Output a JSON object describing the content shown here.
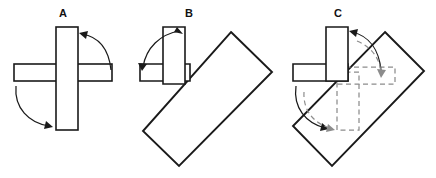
{
  "figure": {
    "width": 436,
    "height": 178,
    "background": "#ffffff"
  },
  "colors": {
    "stroke_solid": "#1a1a1a",
    "stroke_ghost": "#8c8c8c",
    "fill": "#ffffff",
    "label": "#111111"
  },
  "panels": [
    {
      "id": "A",
      "label": "A",
      "label_x": 63,
      "label_y": 17,
      "shapes": {
        "vertical_bar": {
          "x": 56,
          "y": 27,
          "width": 22,
          "height": 103
        },
        "horizontal_bar": {
          "x": 14,
          "y": 64,
          "width": 98,
          "height": 17
        }
      },
      "arcs": [
        {
          "name": "upper-right-rotation-arrow",
          "path": "M 80 34 C 98 36 108 50 110 70",
          "arrowhead": {
            "x": 80,
            "y": 34,
            "angle": 200
          }
        },
        {
          "name": "lower-left-rotation-arrow",
          "path": "M 16 84 C 14 106 28 122 50 126",
          "arrowhead": {
            "x": 52,
            "y": 126,
            "angle": 20
          }
        }
      ]
    },
    {
      "id": "B",
      "label": "B",
      "label_x": 189,
      "label_y": 17,
      "shapes": {
        "vertical_bar": {
          "x": 163,
          "y": 27,
          "width": 22,
          "height": 54
        },
        "horizontal_bar": {
          "x": 140,
          "y": 64,
          "width": 45,
          "height": 17
        },
        "rotated_rect": {
          "points": "231,32 272,72 179,166 143,131",
          "corners": [
            {
              "name": "top",
              "x": 231,
              "y": 32
            },
            {
              "name": "right",
              "x": 272,
              "y": 72
            },
            {
              "name": "bottom",
              "x": 179,
              "y": 166
            },
            {
              "name": "left",
              "x": 143,
              "y": 131
            }
          ]
        }
      },
      "arcs": [
        {
          "name": "rotation-arrow",
          "path": "M 181 32 C 160 34 146 48 143 68",
          "arrowhead": {
            "x": 143,
            "y": 70,
            "angle": 100
          }
        }
      ]
    },
    {
      "id": "C",
      "label": "C",
      "label_x": 338,
      "label_y": 17,
      "shapes": {
        "vertical_bar": {
          "x": 326,
          "y": 27,
          "width": 22,
          "height": 54
        },
        "horizontal_bar": {
          "x": 293,
          "y": 64,
          "width": 55,
          "height": 17
        },
        "rotated_rect": {
          "points": "385,32 424,71 332,166 293,126",
          "corners": [
            {
              "name": "top",
              "x": 385,
              "y": 32
            },
            {
              "name": "right",
              "x": 424,
              "y": 71
            },
            {
              "name": "bottom",
              "x": 332,
              "y": 166
            },
            {
              "name": "left",
              "x": 293,
              "y": 126
            }
          ]
        },
        "ghost_vertical_bar": {
          "x": 337,
          "y": 72,
          "width": 22,
          "height": 58
        },
        "ghost_horizontal_bar": {
          "x": 337,
          "y": 67,
          "width": 58,
          "height": 17
        }
      },
      "arcs": [
        {
          "name": "upper-rotation-arrow-solid",
          "path": "M 350 32 C 368 36 378 50 381 70",
          "arrowhead": {
            "x": 350,
            "y": 32,
            "angle": 200
          }
        },
        {
          "name": "upper-rotation-arrow-dashed",
          "path": "M 356 38 C 372 44 380 58 381 74",
          "arrowhead": {
            "x": 381,
            "y": 76,
            "angle": 85
          }
        },
        {
          "name": "lower-rotation-arrow-solid",
          "path": "M 296 84 C 293 106 305 122 326 128",
          "arrowhead": {
            "x": 328,
            "y": 128,
            "angle": 18
          }
        },
        {
          "name": "lower-rotation-arrow-dashed",
          "path": "M 303 88 C 302 108 312 122 331 128",
          "arrowhead": {
            "x": 333,
            "y": 129,
            "angle": 18
          }
        }
      ]
    }
  ]
}
